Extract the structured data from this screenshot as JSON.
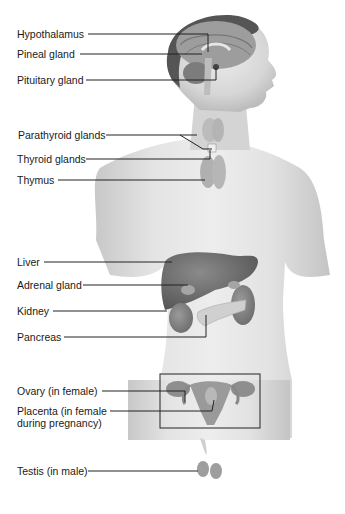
{
  "diagram": {
    "labels": [
      {
        "id": "hypothalamus",
        "text": "Hypothalamus"
      },
      {
        "id": "pineal",
        "text": "Pineal gland"
      },
      {
        "id": "pituitary",
        "text": "Pituitary gland"
      },
      {
        "id": "parathyroid",
        "text": "Parathyroid glands"
      },
      {
        "id": "thyroid",
        "text": "Thyroid glands"
      },
      {
        "id": "thymus",
        "text": "Thymus"
      },
      {
        "id": "liver",
        "text": "Liver"
      },
      {
        "id": "adrenal",
        "text": "Adrenal gland"
      },
      {
        "id": "kidney",
        "text": "Kidney"
      },
      {
        "id": "pancreas",
        "text": "Pancreas"
      },
      {
        "id": "ovary",
        "text": "Ovary (in female)"
      },
      {
        "id": "placenta_1",
        "text": "Placenta (in female"
      },
      {
        "id": "placenta_2",
        "text": "during pregnancy)"
      },
      {
        "id": "testis",
        "text": "Testis (in male)"
      }
    ],
    "colors": {
      "skin": "#d8d8d8",
      "skin_shadow": "#b8b8b8",
      "organ_dark": "#6f6f6f",
      "organ_mid": "#8c8c8c",
      "line": "#222222"
    }
  }
}
